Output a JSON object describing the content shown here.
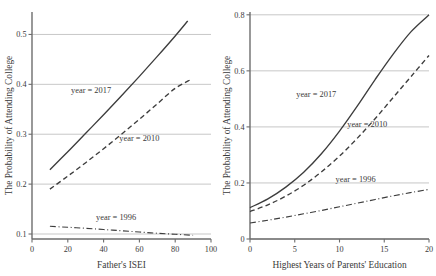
{
  "figure": {
    "panel_count": 2,
    "background": "#ffffff",
    "line_color": "#3d3d3d",
    "grid_color": "#b9b9b9",
    "axis_color": "#6d6d6d"
  },
  "chart_data": [
    {
      "type": "line",
      "panel": "left",
      "title": "",
      "xlabel": "Father's ISEI",
      "ylabel": "The Probability of Attending College",
      "xlim": [
        0,
        100
      ],
      "ylim": [
        0.09,
        0.545
      ],
      "xticks": [
        0,
        20,
        40,
        60,
        80,
        100
      ],
      "xticklabels": [
        "0",
        "20",
        "40",
        "60",
        "80",
        "100"
      ],
      "yticks": [
        0.1,
        0.2,
        0.3,
        0.4,
        0.5
      ],
      "yticklabels": [
        "0.1",
        "0.2",
        "0.3",
        "0.4",
        "0.5"
      ],
      "grid": "horizontal",
      "legend": "inline-annotations",
      "series": [
        {
          "name": "year = 2017",
          "style": "solid",
          "label_x": 33,
          "label_y": 0.383,
          "x": [
            10,
            20,
            30,
            40,
            50,
            60,
            70,
            80,
            87
          ],
          "values": [
            0.229,
            0.265,
            0.302,
            0.339,
            0.377,
            0.416,
            0.456,
            0.497,
            0.527
          ]
        },
        {
          "name": "year = 2010",
          "style": "dashed",
          "label_x": 60,
          "label_y": 0.287,
          "x": [
            10,
            20,
            30,
            40,
            50,
            60,
            70,
            80,
            89
          ],
          "values": [
            0.19,
            0.216,
            0.243,
            0.271,
            0.3,
            0.33,
            0.361,
            0.392,
            0.41
          ]
        },
        {
          "name": "year = 1996",
          "style": "dashdot",
          "label_x": 47,
          "label_y": 0.128,
          "x": [
            10,
            20,
            30,
            40,
            50,
            60,
            70,
            80,
            90
          ],
          "values": [
            0.1155,
            0.1135,
            0.1115,
            0.109,
            0.1065,
            0.104,
            0.1015,
            0.0995,
            0.0975
          ]
        }
      ]
    },
    {
      "type": "line",
      "panel": "right",
      "title": "",
      "xlabel": "Highest Years of Parents' Education",
      "ylabel": "The Probability of Attending College",
      "xlim": [
        0,
        20
      ],
      "ylim": [
        0,
        0.81
      ],
      "xticks": [
        0,
        5,
        10,
        15,
        20
      ],
      "xticklabels": [
        "0",
        "5",
        "10",
        "15",
        "20"
      ],
      "yticks": [
        0,
        0.2,
        0.4,
        0.6,
        0.8
      ],
      "yticklabels": [
        "0",
        "0.2",
        "0.4",
        "0.6",
        "0.8"
      ],
      "grid": "horizontal",
      "legend": "inline-annotations",
      "series": [
        {
          "name": "year = 2017",
          "style": "solid",
          "label_x": 7.4,
          "label_y": 0.505,
          "x": [
            0,
            2,
            4,
            6,
            8,
            10,
            12,
            14,
            16,
            18,
            20
          ],
          "values": [
            0.112,
            0.143,
            0.185,
            0.238,
            0.305,
            0.385,
            0.475,
            0.57,
            0.66,
            0.74,
            0.8
          ]
        },
        {
          "name": "year = 2010",
          "style": "dashed",
          "label_x": 13.1,
          "label_y": 0.4,
          "x": [
            0,
            2,
            4,
            6,
            8,
            10,
            12,
            14,
            16,
            18,
            20
          ],
          "values": [
            0.098,
            0.122,
            0.153,
            0.192,
            0.24,
            0.296,
            0.36,
            0.43,
            0.505,
            0.58,
            0.655
          ]
        },
        {
          "name": "year = 1996",
          "style": "dashdot",
          "label_x": 11.8,
          "label_y": 0.205,
          "x": [
            0,
            2,
            4,
            6,
            8,
            10,
            12,
            14,
            16,
            18,
            20
          ],
          "values": [
            0.057,
            0.067,
            0.078,
            0.09,
            0.102,
            0.115,
            0.128,
            0.141,
            0.154,
            0.166,
            0.177
          ]
        }
      ]
    }
  ]
}
